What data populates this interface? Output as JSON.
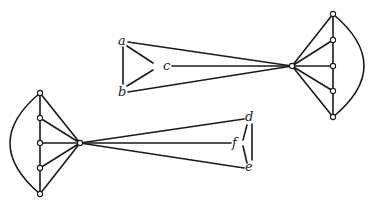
{
  "figure": {
    "labels": [
      {
        "id": "a",
        "text": "a",
        "x": 118,
        "y": 45
      },
      {
        "id": "b",
        "text": "b",
        "x": 118,
        "y": 96
      },
      {
        "id": "c",
        "text": "c",
        "x": 163,
        "y": 70
      },
      {
        "id": "d",
        "text": "d",
        "x": 245,
        "y": 121
      },
      {
        "id": "e",
        "text": "e",
        "x": 245,
        "y": 171
      },
      {
        "id": "f",
        "text": "f",
        "x": 232,
        "y": 147
      }
    ],
    "colors": {
      "stroke": "#1a1a1a",
      "background": "#ffffff"
    }
  }
}
